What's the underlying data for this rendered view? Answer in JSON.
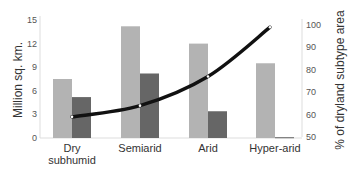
{
  "chart_data": {
    "type": "bar",
    "title": "",
    "categories": [
      "Dry subhumid",
      "Semiarid",
      "Arid",
      "Hyper-arid"
    ],
    "category_lines": [
      [
        "Dry",
        "subhumid"
      ],
      [
        "Semiarid"
      ],
      [
        "Arid"
      ],
      [
        "Hyper-arid"
      ]
    ],
    "series": [
      {
        "name": "Total area",
        "type": "bar",
        "axis": "left",
        "color": "#b3b3b3",
        "values": [
          7.5,
          14.2,
          12.0,
          9.5
        ]
      },
      {
        "name": "Subset area",
        "type": "bar",
        "axis": "left",
        "color": "#666666",
        "values": [
          5.2,
          8.2,
          3.4,
          0.1
        ]
      },
      {
        "name": "% of dryland subtype area",
        "type": "line",
        "axis": "right",
        "color": "#111111",
        "values": [
          59,
          64,
          77,
          99
        ]
      }
    ],
    "ylabel": "Million sq. km.",
    "ylim": [
      0,
      15
    ],
    "yticks": [
      0,
      3,
      6,
      9,
      12,
      15
    ],
    "y2label": "% of dryland subtype area",
    "y2lim": [
      50,
      100
    ],
    "y2ticks": [
      50,
      60,
      70,
      80,
      90,
      100
    ],
    "xlabel": "",
    "grid": false,
    "legend": null
  }
}
